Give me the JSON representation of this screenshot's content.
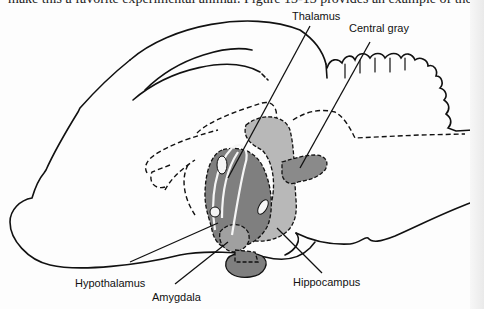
{
  "caption_fragment": "make this a favorite experimental animal. Figure 13-13 provides an example of the",
  "diagram": {
    "labels": [
      {
        "id": "thalamus",
        "text": "Thalamus"
      },
      {
        "id": "central_gray",
        "text": "Central gray"
      },
      {
        "id": "hypothalamus",
        "text": "Hypothalamus"
      },
      {
        "id": "amygdala",
        "text": "Amygdala"
      },
      {
        "id": "hippocampus",
        "text": "Hippocampus"
      }
    ],
    "colors": {
      "outline": "#111111",
      "dark_gray": "#7a7a7a",
      "mid_gray": "#9a9a9a",
      "light_gray": "#b8b8b8",
      "background": "#fdfdfd"
    }
  }
}
